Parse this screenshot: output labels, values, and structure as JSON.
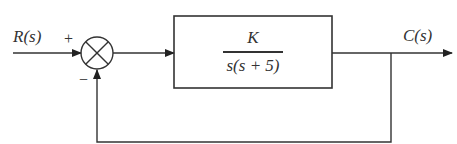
{
  "diagram": {
    "type": "negative feedback control loop",
    "input_label": "R(s)",
    "output_label": "C(s)",
    "summing_junction": {
      "plus_sign": "+",
      "minus_sign": "−"
    },
    "forward_block": {
      "numerator": "K",
      "denominator": "s(s + 5)"
    },
    "colors": {
      "line": "#333333",
      "background": "#ffffff"
    }
  }
}
